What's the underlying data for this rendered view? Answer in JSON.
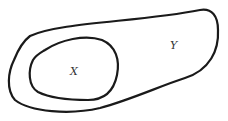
{
  "diagram": {
    "type": "venn-subset",
    "sets": [
      {
        "id": "Y",
        "label": "Y",
        "role": "outer"
      },
      {
        "id": "X",
        "label": "X",
        "role": "inner",
        "subset_of": "Y"
      }
    ],
    "colors": {
      "stroke": "#1a1a1a",
      "label": "#333333",
      "background": "#ffffff"
    }
  }
}
